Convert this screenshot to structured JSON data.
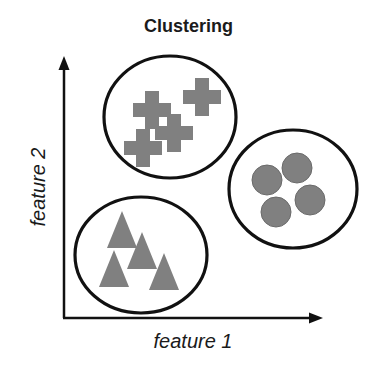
{
  "title": "Clustering",
  "axes": {
    "x_label": "feature 1",
    "y_label": "feature 2"
  },
  "colors": {
    "shape_fill": "#808080",
    "outline": "#111111",
    "background": "#ffffff"
  },
  "clusters": [
    {
      "name": "cluster-crosses",
      "shape": "cross",
      "count": 4,
      "ellipse": {
        "cx": 170,
        "cy": 117,
        "rx": 66,
        "ry": 61
      },
      "points": [
        [
          202,
          97
        ],
        [
          152,
          110
        ],
        [
          174,
          133
        ],
        [
          143,
          148
        ]
      ]
    },
    {
      "name": "cluster-circles",
      "shape": "circle",
      "count": 4,
      "ellipse": {
        "cx": 293,
        "cy": 189,
        "rx": 64,
        "ry": 59
      },
      "points": [
        [
          297,
          168
        ],
        [
          267,
          180
        ],
        [
          310,
          200
        ],
        [
          276,
          212
        ]
      ]
    },
    {
      "name": "cluster-triangles",
      "shape": "triangle",
      "count": 4,
      "ellipse": {
        "cx": 141,
        "cy": 255,
        "rx": 66,
        "ry": 58
      },
      "points": [
        [
          122,
          230
        ],
        [
          142,
          251
        ],
        [
          114,
          269
        ],
        [
          164,
          272
        ]
      ]
    }
  ]
}
